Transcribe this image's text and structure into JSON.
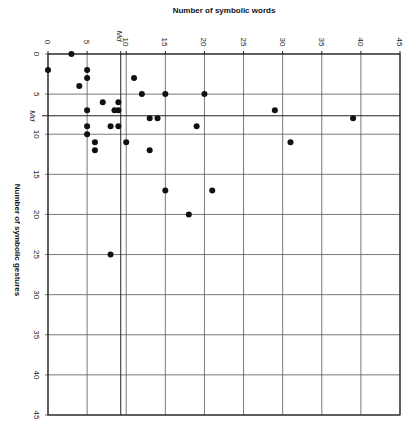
{
  "chart_data": {
    "type": "scatter",
    "title": "",
    "xlabel": "Number of symbolic words",
    "ylabel": "Number of symbolic gestures",
    "xlim": [
      0,
      45
    ],
    "ylim": [
      0,
      45
    ],
    "y_inverted": true,
    "x_axis_position": "top",
    "grid": true,
    "x_ticks": [
      0,
      5,
      10,
      15,
      20,
      25,
      30,
      35,
      40,
      45
    ],
    "y_ticks": [
      0,
      5,
      10,
      15,
      20,
      25,
      30,
      35,
      40,
      45
    ],
    "median_lines": {
      "label": "Md",
      "x_median": 9.3,
      "y_median": 7.7
    },
    "points": [
      {
        "x": 3,
        "y": 0
      },
      {
        "x": 0,
        "y": 2
      },
      {
        "x": 5,
        "y": 2
      },
      {
        "x": 5,
        "y": 3
      },
      {
        "x": 4,
        "y": 4
      },
      {
        "x": 11,
        "y": 3
      },
      {
        "x": 12,
        "y": 5
      },
      {
        "x": 15,
        "y": 5
      },
      {
        "x": 20,
        "y": 5
      },
      {
        "x": 7,
        "y": 6
      },
      {
        "x": 9,
        "y": 6
      },
      {
        "x": 8.5,
        "y": 7
      },
      {
        "x": 9,
        "y": 7
      },
      {
        "x": 5,
        "y": 7
      },
      {
        "x": 29,
        "y": 7
      },
      {
        "x": 13,
        "y": 8
      },
      {
        "x": 14,
        "y": 8
      },
      {
        "x": 39,
        "y": 8
      },
      {
        "x": 5,
        "y": 9
      },
      {
        "x": 8,
        "y": 9
      },
      {
        "x": 9,
        "y": 9
      },
      {
        "x": 19,
        "y": 9
      },
      {
        "x": 5,
        "y": 10
      },
      {
        "x": 6,
        "y": 11
      },
      {
        "x": 10,
        "y": 11
      },
      {
        "x": 31,
        "y": 11
      },
      {
        "x": 6,
        "y": 12
      },
      {
        "x": 13,
        "y": 12
      },
      {
        "x": 15,
        "y": 17
      },
      {
        "x": 21,
        "y": 17
      },
      {
        "x": 18,
        "y": 20
      },
      {
        "x": 8,
        "y": 25
      }
    ]
  },
  "colors": {
    "grid": "#555555",
    "axis": "#222222",
    "point": "#111111",
    "background": "#ffffff"
  }
}
